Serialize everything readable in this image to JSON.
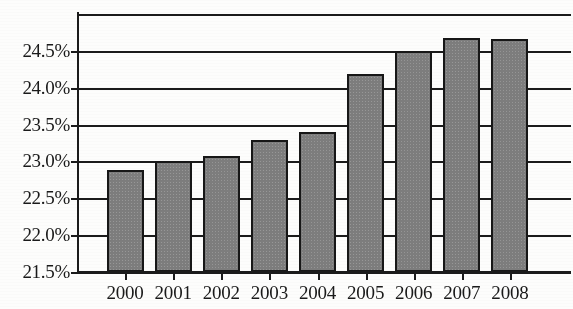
{
  "chart_data": {
    "type": "bar",
    "title": "",
    "subtitle": "",
    "xlabel": "",
    "ylabel": "",
    "categories": [
      "2000",
      "2001",
      "2002",
      "2003",
      "2004",
      "2005",
      "2006",
      "2007",
      "2008"
    ],
    "values": [
      22.88,
      23.0,
      23.08,
      23.29,
      23.4,
      24.18,
      24.5,
      24.67,
      24.66
    ],
    "value_unit": "%",
    "ylim": [
      21.5,
      25.0
    ],
    "ytick_values": [
      21.5,
      22.0,
      22.5,
      23.0,
      23.5,
      24.0,
      24.5
    ],
    "ytick_labels": [
      "21.5%",
      "22.0%",
      "22.5%",
      "23.0%",
      "23.5%",
      "24.0%",
      "24.5%"
    ],
    "gridline_values": [
      21.5,
      22.0,
      22.5,
      23.0,
      23.5,
      24.0,
      24.5,
      25.0
    ],
    "grid": true,
    "grid_axis": "y",
    "legend": false,
    "legend_position": "none",
    "bar_fill_color": "#7d7d7d",
    "bar_outline_color": "#171717",
    "axis_color": "#1b1b1b",
    "background_color": "#fdfdfc",
    "series": [
      {
        "name": "",
        "values": [
          22.88,
          23.0,
          23.08,
          23.29,
          23.4,
          24.18,
          24.5,
          24.67,
          24.66
        ]
      }
    ]
  }
}
